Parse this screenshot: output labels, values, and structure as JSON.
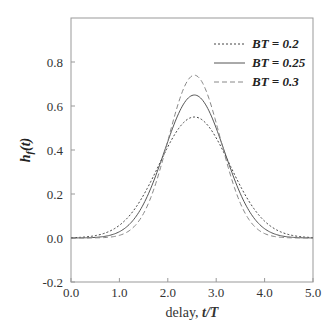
{
  "chart_data": {
    "type": "line",
    "title": "",
    "xlabel": "delay, t/T",
    "xlabel_parts": {
      "plain": "delay, ",
      "italic": "t/T"
    },
    "ylabel": "h_f(t)",
    "xlim": [
      0.0,
      5.0
    ],
    "ylim": [
      -0.2,
      1.0
    ],
    "xticks": [
      "0.0",
      "1.0",
      "2.0",
      "3.0",
      "4.0",
      "5.0"
    ],
    "yticks": [
      "-0.2",
      "0.0",
      "0.2",
      "0.4",
      "0.6",
      "0.8"
    ],
    "grid": false,
    "legend_position": "upper right",
    "series": [
      {
        "name": "BT = 0.2",
        "style": "dotted",
        "color": "#444444",
        "center": 2.55,
        "peak": 0.55,
        "sigma": 0.73
      },
      {
        "name": "BT = 0.25",
        "style": "solid",
        "color": "#555555",
        "center": 2.55,
        "peak": 0.65,
        "sigma": 0.62
      },
      {
        "name": "BT = 0.3",
        "style": "dashed",
        "color": "#888888",
        "center": 2.55,
        "peak": 0.74,
        "sigma": 0.54
      }
    ],
    "x": [
      0.0,
      0.5,
      1.0,
      1.5,
      2.0,
      2.25,
      2.5,
      2.55,
      2.75,
      3.0,
      3.5,
      4.0,
      4.5,
      5.0
    ],
    "series_values": {
      "BT = 0.2": [
        0.0,
        0.0,
        0.06,
        0.19,
        0.42,
        0.51,
        0.55,
        0.55,
        0.53,
        0.45,
        0.24,
        0.08,
        0.01,
        0.0
      ],
      "BT = 0.25": [
        0.0,
        0.0,
        0.03,
        0.16,
        0.44,
        0.58,
        0.65,
        0.65,
        0.61,
        0.5,
        0.2,
        0.04,
        0.0,
        0.0
      ],
      "BT = 0.3": [
        0.0,
        0.0,
        0.01,
        0.11,
        0.45,
        0.63,
        0.74,
        0.74,
        0.69,
        0.52,
        0.15,
        0.02,
        0.0,
        0.0
      ]
    }
  }
}
